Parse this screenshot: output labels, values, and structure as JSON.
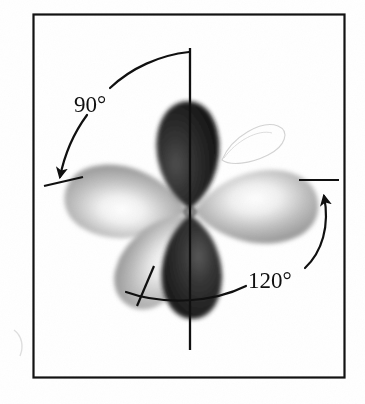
{
  "figure": {
    "frame": {
      "border_color": "#101010",
      "background": "#ffffff",
      "x": 33,
      "y": 14,
      "width": 311,
      "height": 363
    },
    "center_node": {
      "x": 190,
      "y": 212
    },
    "axis_line": {
      "label": "vertical-axis",
      "color": "#101010",
      "x": 190,
      "y_top": 48,
      "y_bottom": 350
    },
    "annotations": [
      {
        "id": "angle-90",
        "label": "90°",
        "value": 90,
        "unit": "degrees",
        "text_x": 74,
        "text_y": 103,
        "arrow_from": {
          "x": 190,
          "y": 52
        },
        "arrow_to": {
          "x": 59,
          "y": 180
        }
      },
      {
        "id": "angle-120",
        "label": "120°",
        "value": 120,
        "unit": "degrees",
        "text_x": 249,
        "text_y": 283,
        "arrow_from": {
          "x": 126,
          "y": 292
        },
        "arrow_to": {
          "x": 322,
          "y": 184
        }
      }
    ],
    "tick_marks": [
      {
        "id": "tick-left",
        "x1": 44,
        "y1": 186,
        "x2": 82,
        "y2": 178
      },
      {
        "id": "tick-right",
        "x1": 300,
        "y1": 180,
        "x2": 338,
        "y2": 180
      },
      {
        "id": "tick-lower-left",
        "x1": 152,
        "y1": 268,
        "x2": 138,
        "y2": 305
      }
    ],
    "lobes": [
      {
        "id": "lobe-up",
        "direction": "up",
        "shade": "dark",
        "color": "#1a1a1a",
        "highlight": "#6b6b6b",
        "angle_deg": -90,
        "length": 115,
        "width": 62
      },
      {
        "id": "lobe-left",
        "direction": "left",
        "shade": "light",
        "color": "#9a9a9a",
        "highlight": "#ffffff",
        "angle_deg": 188,
        "length": 120,
        "width": 72
      },
      {
        "id": "lobe-right",
        "direction": "right",
        "shade": "light",
        "color": "#9a9a9a",
        "highlight": "#ffffff",
        "angle_deg": -4,
        "length": 122,
        "width": 70
      },
      {
        "id": "lobe-lower-left",
        "direction": "lower-left",
        "shade": "light",
        "color": "#8f8f8f",
        "highlight": "#ffffff",
        "angle_deg": 112,
        "length": 105,
        "width": 64
      },
      {
        "id": "lobe-down",
        "direction": "down",
        "shade": "dark",
        "color": "#1a1a1a",
        "highlight": "#6b6b6b",
        "angle_deg": 90,
        "length": 112,
        "width": 58
      }
    ],
    "ghost_outline": {
      "id": "ghost-lobe-outline",
      "description": "faint registration outline of upper-right lobe",
      "color": "#c9c9c9"
    }
  }
}
